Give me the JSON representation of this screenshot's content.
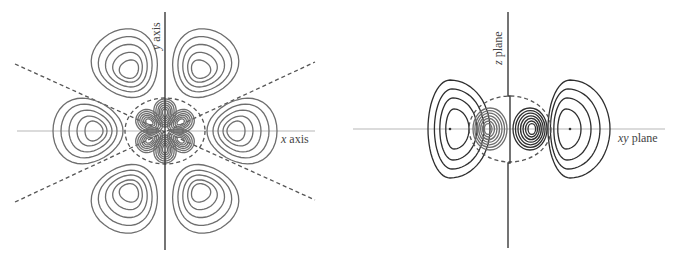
{
  "figure": {
    "left_panel": {
      "title": "d-orbital contour plot in xy cross-section",
      "vertical_axis_label_var": "y",
      "vertical_axis_label_word": " axis",
      "horizontal_axis_label_var": "x",
      "horizontal_axis_label_word": " axis",
      "outer_lobe_count": 6,
      "inner_lobe_count": 6,
      "nodal_lines": 2,
      "colors": {
        "contour": "#6e6e6e",
        "axis": "#3a3a3a",
        "guide": "#b8b8b8"
      }
    },
    "right_panel": {
      "title": "orbital contour plot in z cross-section",
      "vertical_axis_label_var": "z",
      "vertical_axis_label_word": " plane",
      "horizontal_axis_label_var": "xy",
      "horizontal_axis_label_word": " plane",
      "outer_lobe_count": 2,
      "inner_lobe_count": 2,
      "colors": {
        "contour": "#2e2e2e",
        "axis": "#3a3a3a",
        "guide": "#b8b8b8"
      }
    }
  }
}
